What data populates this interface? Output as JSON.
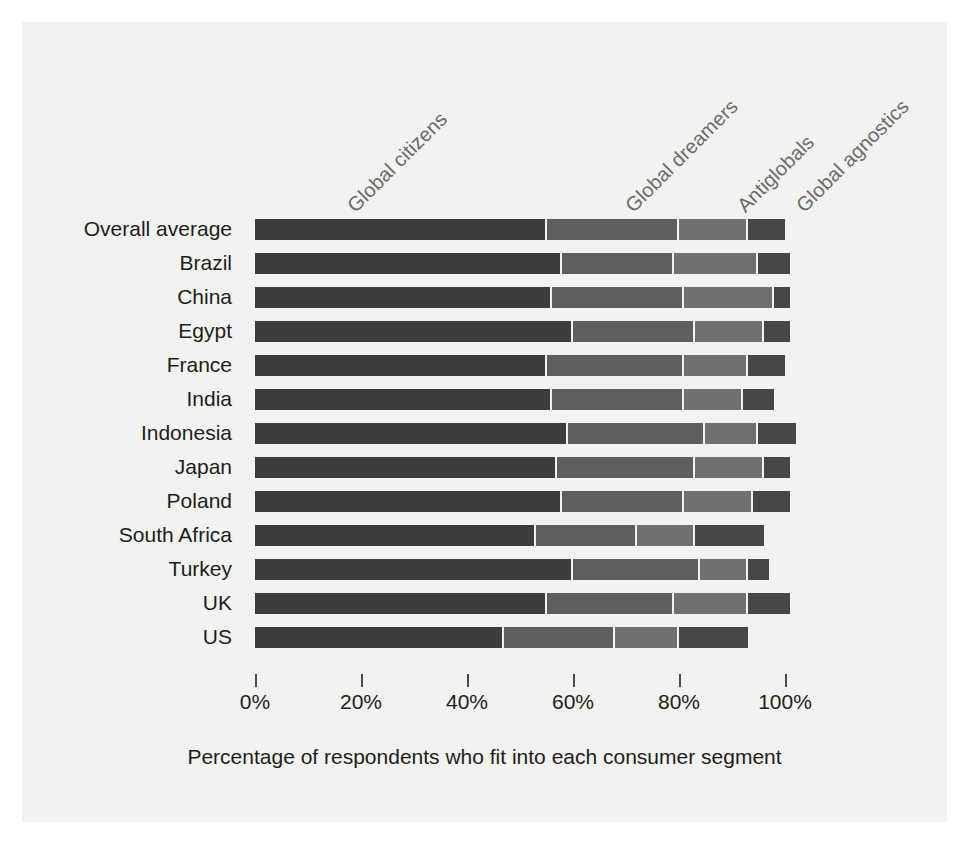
{
  "figure": {
    "background_color": "#f2f2f0",
    "axis_title": "Percentage of respondents who fit into each consumer segment"
  },
  "chart_data": {
    "type": "bar",
    "subtype": "horizontal-stacked",
    "title": "",
    "subtitle": "",
    "xlabel": "Percentage of respondents who fit into each consumer segment",
    "ylabel": "",
    "xlim": [
      0,
      108
    ],
    "grid": false,
    "legend_position": "top-rotated-inline",
    "xticks": [
      0,
      20,
      40,
      60,
      80,
      100
    ],
    "xtick_labels": [
      "0%",
      "20%",
      "40%",
      "60%",
      "80%",
      "100%"
    ],
    "categories": [
      "Overall average",
      "Brazil",
      "China",
      "Egypt",
      "France",
      "India",
      "Indonesia",
      "Japan",
      "Poland",
      "South Africa",
      "Turkey",
      "UK",
      "US"
    ],
    "series": [
      {
        "name": "Global citizens",
        "color": "#3c3c3c",
        "values": [
          55,
          58,
          56,
          60,
          55,
          56,
          59,
          57,
          58,
          53,
          60,
          55,
          47
        ]
      },
      {
        "name": "Global dreamers",
        "color": "#5e5e5e",
        "values": [
          25,
          21,
          25,
          23,
          26,
          25,
          26,
          26,
          23,
          19,
          24,
          24,
          21
        ]
      },
      {
        "name": "Antiglobals",
        "color": "#707070",
        "values": [
          13,
          16,
          17,
          13,
          12,
          11,
          10,
          13,
          13,
          11,
          9,
          14,
          12
        ]
      },
      {
        "name": "Global agnostics",
        "color": "#474747",
        "values": [
          7,
          6,
          3,
          5,
          7,
          6,
          7,
          5,
          7,
          13,
          4,
          8,
          13
        ]
      }
    ]
  }
}
